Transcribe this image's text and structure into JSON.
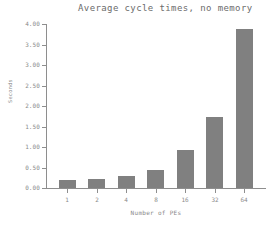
{
  "chart_data": {
    "type": "bar",
    "title": "Average cycle times, no memory",
    "xlabel": "Number of PEs",
    "ylabel": "Seconds",
    "categories": [
      "1",
      "2",
      "4",
      "8",
      "16",
      "32",
      "64"
    ],
    "values": [
      0.2,
      0.22,
      0.3,
      0.45,
      0.92,
      1.72,
      3.89
    ],
    "ylim": [
      0.0,
      4.0
    ],
    "ytick_values": [
      0.0,
      0.5,
      1.0,
      1.5,
      2.0,
      2.5,
      3.0,
      3.5,
      4.0
    ],
    "ytick_labels": [
      "0.00",
      "0.50",
      "1.00",
      "1.50",
      "2.00",
      "2.50",
      "3.00",
      "3.50",
      "4.00"
    ],
    "grid": false,
    "legend": null,
    "bar_color": "#808080",
    "axis_color": "#8e8e8e",
    "text_color": "#8a8a8a",
    "title_color": "#6b6b6b",
    "background": "#ffffff"
  }
}
